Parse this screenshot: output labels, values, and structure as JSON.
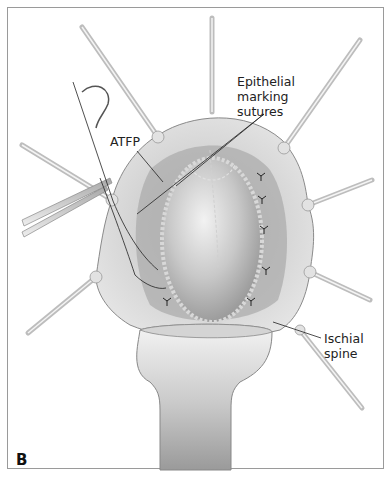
{
  "figure": {
    "panel_letter": "B",
    "labels": {
      "epithelial_marking_sutures": [
        "Epithelial",
        "marking",
        "sutures"
      ],
      "atfp": "ATFP",
      "ischial_spine": [
        "Ischial",
        "spine"
      ]
    },
    "elements": [
      "vaginal-wall-exposure",
      "central-bladder-bulge",
      "retractors",
      "weighted-speculum",
      "curved-needle",
      "needle-holder",
      "interrupted-sutures"
    ]
  },
  "colors": {
    "frame_border": "#9a9a9a",
    "tissue_light": "#e6e6e6",
    "tissue_mid": "#c4c4c4",
    "tissue_dark": "#9e9e9e",
    "instrument": "#d8d8d8",
    "line": "#333333"
  }
}
